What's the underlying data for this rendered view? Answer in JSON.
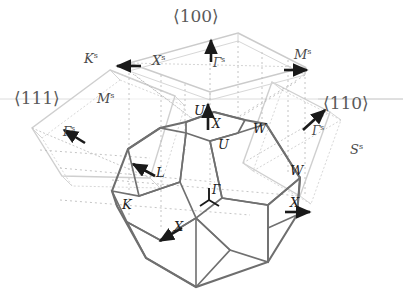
{
  "figure": {
    "colors": {
      "bulk_edge": "#6e6e6e",
      "bulk_edge_dark": "#575757",
      "surface_plane": "#c9c9c9",
      "dotted_guide": "#b0b0b0",
      "arrow": "#1a1a1a",
      "label_bulk": "#1d1d1d",
      "label_surface": "#4a4a4a",
      "direction_label": "#5a5a5a",
      "background": "#ffffff"
    }
  },
  "directions": [
    {
      "name": "direction-100",
      "text": "⟨100⟩",
      "x": 173,
      "y": 8,
      "size": 17
    },
    {
      "name": "direction-111",
      "text": "⟨111⟩",
      "x": 14,
      "y": 90,
      "size": 17
    },
    {
      "name": "direction-110",
      "text": "⟨110⟩",
      "x": 323,
      "y": 95,
      "size": 17
    }
  ],
  "surface_labels": [
    {
      "name": "surface-point-K-100",
      "base": "K",
      "sup": "s",
      "x": 84,
      "y": 52,
      "size": 13
    },
    {
      "name": "surface-point-X-100",
      "base": "X",
      "sup": "s",
      "x": 152,
      "y": 54,
      "size": 13
    },
    {
      "name": "surface-point-Gamma-100",
      "base": "Γ",
      "sup": "s",
      "x": 213,
      "y": 56,
      "size": 12
    },
    {
      "name": "surface-point-M-100",
      "base": "M",
      "sup": "s",
      "x": 294,
      "y": 48,
      "size": 13
    },
    {
      "name": "surface-point-M-111",
      "base": "M",
      "sup": "s",
      "x": 97,
      "y": 92,
      "size": 13
    },
    {
      "name": "surface-point-Gamma-111",
      "base": "Γ",
      "sup": "s",
      "x": 63,
      "y": 125,
      "size": 12
    },
    {
      "name": "surface-point-Gamma-110",
      "base": "Γ",
      "sup": "s",
      "x": 312,
      "y": 124,
      "size": 12
    },
    {
      "name": "surface-point-S-110",
      "base": "S",
      "sup": "s",
      "x": 350,
      "y": 143,
      "size": 13
    }
  ],
  "bulk_labels": [
    {
      "name": "bulk-point-U-upper",
      "text": "U",
      "x": 194,
      "y": 104,
      "size": 13
    },
    {
      "name": "bulk-point-X-top",
      "text": "X",
      "x": 212,
      "y": 118,
      "size": 12
    },
    {
      "name": "bulk-point-W-upper",
      "text": "W",
      "x": 253,
      "y": 122,
      "size": 13
    },
    {
      "name": "bulk-point-U-lower",
      "text": "U",
      "x": 218,
      "y": 138,
      "size": 13
    },
    {
      "name": "bulk-point-L",
      "text": "L",
      "x": 156,
      "y": 166,
      "size": 13
    },
    {
      "name": "bulk-point-W-right",
      "text": "W",
      "x": 290,
      "y": 164,
      "size": 13
    },
    {
      "name": "bulk-point-Gamma-center",
      "text": "Γ",
      "x": 212,
      "y": 184,
      "size": 12
    },
    {
      "name": "bulk-point-K",
      "text": "K",
      "x": 122,
      "y": 198,
      "size": 13
    },
    {
      "name": "bulk-point-X-right",
      "text": "X",
      "x": 290,
      "y": 196,
      "size": 13
    },
    {
      "name": "bulk-point-X-bottom",
      "text": "X",
      "x": 174,
      "y": 220,
      "size": 13
    }
  ],
  "legend_note": {
    "bulk_zone": "truncated octahedron (fcc bulk Brillouin zone)",
    "surface_zones": [
      "(100) square",
      "(111) hexagon",
      "(110) rectangle"
    ]
  }
}
